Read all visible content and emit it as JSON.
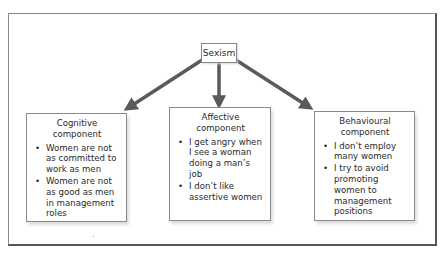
{
  "diagram": {
    "root": {
      "label": "Sexism"
    },
    "components": [
      {
        "title_line1": "Cognitive",
        "title_line2": "component",
        "items": [
          "Women are not as committed to work as men",
          "Women are not as good as men in management roles"
        ]
      },
      {
        "title_line1": "Affective",
        "title_line2": "component",
        "items": [
          "I get angry when I see a woman doing a man’s job",
          "I don’t like assertive women"
        ]
      },
      {
        "title_line1": "Behavioural",
        "title_line2": "component",
        "items": [
          "I don’t employ many women",
          "I try to avoid promoting women to management positions"
        ]
      }
    ],
    "bullet_glyph": "•",
    "colors": {
      "arrow": "#5a5a5a",
      "border": "#8a8a8a",
      "frame": "#555555"
    }
  }
}
